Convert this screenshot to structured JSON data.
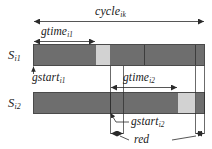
{
  "figure": {
    "type": "timing-diagram",
    "colors": {
      "green_band": "#6e6e6e",
      "amber_band": "#d2d2d2",
      "outline": "#4a4a4a",
      "text": "#1a1a1a",
      "background": "#ffffff"
    }
  },
  "labels": {
    "cycle": "cycle",
    "cycle_sub": "ik",
    "gtime1": "gtime",
    "gtime1_sub": "i1",
    "gtime2": "gtime",
    "gtime2_sub": "i2",
    "gstart1": "gstart",
    "gstart1_sub": "i1",
    "gstart2": "gstart",
    "gstart2_sub": "i2",
    "red": "red",
    "signal1": "S",
    "signal1_sub": "i1",
    "signal2": "S",
    "signal2_sub": "i2"
  },
  "rows": [
    {
      "name": "S_i1",
      "label": "S",
      "sublabel": "i1",
      "segments": [
        {
          "kind": "green",
          "x": 33,
          "width": 63
        },
        {
          "kind": "amber",
          "x": 96,
          "width": 14
        },
        {
          "kind": "green",
          "x": 110,
          "width": 95
        }
      ]
    },
    {
      "name": "S_i2",
      "label": "S",
      "sublabel": "i2",
      "segments": [
        {
          "kind": "green",
          "x": 33,
          "width": 145
        },
        {
          "kind": "amber",
          "x": 178,
          "width": 18
        },
        {
          "kind": "green",
          "x": 196,
          "width": 9
        }
      ]
    }
  ],
  "measures": [
    {
      "name": "cycle",
      "from": 33,
      "to": 205,
      "y": 22
    },
    {
      "name": "gtime_i1",
      "from": 33,
      "to": 96,
      "y": 42
    },
    {
      "name": "gtime_i2",
      "from": 110,
      "to": 178,
      "y": 88
    },
    {
      "name": "red",
      "from": 110,
      "to": 205,
      "y": 135
    }
  ]
}
